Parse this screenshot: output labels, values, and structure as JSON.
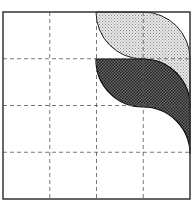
{
  "figure": {
    "type": "grid-shaded-regions",
    "grid": {
      "rows": 4,
      "cols": 4,
      "line_style": "dashed"
    },
    "square": {
      "x": 3,
      "y": 12,
      "size": 187
    },
    "regions": [
      {
        "name": "light-shaded-region",
        "fill": "#d6d6d6",
        "pattern": "light-dots"
      },
      {
        "name": "dark-shaded-region",
        "fill": "#5a5a5a",
        "pattern": "dark-crosshatch"
      }
    ],
    "colors": {
      "border": "#333333",
      "grid": "#555555",
      "background": "#ffffff"
    }
  }
}
